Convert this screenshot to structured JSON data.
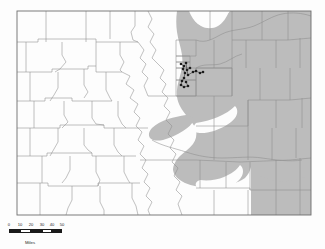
{
  "figure": {
    "kind": "distribution-map",
    "region_name": "Colorado",
    "title_fragment": "",
    "colors": {
      "background": "#fdfdfd",
      "range_shade": "#bcbcbc",
      "county_line": "#8e8e8e",
      "state_border": "#6e6e6e",
      "point_marker": "#1c1c1c",
      "scale_text": "#262626"
    }
  },
  "legend": {
    "range_label": "",
    "points_label": ""
  },
  "scalebar": {
    "tick_labels": [
      "0",
      "10",
      "20",
      "30",
      "40",
      "50"
    ],
    "unit_label": "Miles",
    "max_value": 50,
    "segments": [
      {
        "kind": "dark",
        "from": 0,
        "to": 10
      },
      {
        "kind": "light",
        "from": 10,
        "to": 20
      },
      {
        "kind": "dark",
        "from": 20,
        "to": 30
      },
      {
        "kind": "light",
        "from": 30,
        "to": 40
      },
      {
        "kind": "dark",
        "from": 40,
        "to": 50
      }
    ]
  },
  "map_data": {
    "type": "choropleth-range",
    "state_outline": "17,11 311,11 311,215 17,215",
    "range_polygon_note": "Shaded area = eastern plains distribution extending west to the Front Range, with lobes down the Arkansas River valley and a white notch along the northern border.",
    "occurrence_points": [
      {
        "x": 181,
        "y": 64
      },
      {
        "x": 184,
        "y": 66
      },
      {
        "x": 186,
        "y": 63
      },
      {
        "x": 183,
        "y": 69
      },
      {
        "x": 187,
        "y": 70
      },
      {
        "x": 190,
        "y": 68
      },
      {
        "x": 185,
        "y": 73
      },
      {
        "x": 188,
        "y": 75
      },
      {
        "x": 193,
        "y": 72
      },
      {
        "x": 196,
        "y": 71
      },
      {
        "x": 200,
        "y": 73
      },
      {
        "x": 203,
        "y": 72
      },
      {
        "x": 184,
        "y": 78
      },
      {
        "x": 182,
        "y": 81
      },
      {
        "x": 186,
        "y": 82
      },
      {
        "x": 181,
        "y": 85
      },
      {
        "x": 184,
        "y": 87
      },
      {
        "x": 188,
        "y": 86
      }
    ],
    "point_count": 18
  }
}
